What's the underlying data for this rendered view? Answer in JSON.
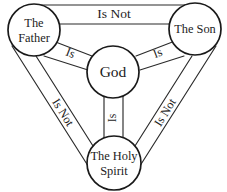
{
  "diagram": {
    "type": "trinity-shield",
    "background_color": "#ffffff",
    "line_color": "#2b2b2b",
    "text_color": "#1c1c1c",
    "nodes": {
      "father": {
        "label_line1": "The",
        "label_line2": "Father",
        "full_label": "The Father"
      },
      "son": {
        "label_line1": "The Son",
        "label_line2": "",
        "full_label": "The Son"
      },
      "holy_spirit": {
        "label_line1": "The Holy",
        "label_line2": "Spirit",
        "full_label": "The Holy Spirit"
      },
      "god": {
        "label_line1": "God",
        "label_line2": "",
        "full_label": "God"
      }
    },
    "edges": {
      "father_son": {
        "label": "Is Not",
        "position": "top"
      },
      "father_spirit": {
        "label": "Is Not",
        "position": "left"
      },
      "son_spirit": {
        "label": "Is Not",
        "position": "right"
      },
      "father_god": {
        "label": "Is",
        "position": "upper-left"
      },
      "son_god": {
        "label": "Is",
        "position": "upper-right"
      },
      "spirit_god": {
        "label": "Is",
        "position": "bottom-center"
      }
    }
  }
}
